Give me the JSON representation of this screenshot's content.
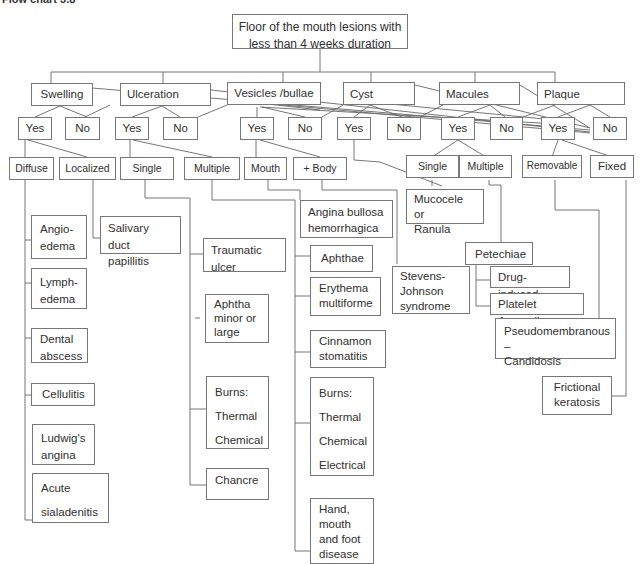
{
  "title": "Flow chart 3.8",
  "root": {
    "label": "Floor of the mouth lesions with less than 4 weeks duration"
  },
  "categories": [
    {
      "label": "Swelling"
    },
    {
      "label": "Ulceration"
    },
    {
      "label": "Vesicles /bullae"
    },
    {
      "label": "Cyst"
    },
    {
      "label": "Macules"
    },
    {
      "label": "Plaque"
    }
  ],
  "answers": {
    "yes": "Yes",
    "no": "No"
  },
  "subtypes": {
    "swelling": [
      "Diffuse",
      "Localized"
    ],
    "ulceration": [
      "Single",
      "Multiple"
    ],
    "vesicles": [
      "Mouth",
      "+ Body"
    ],
    "macules": [
      "Single",
      "Multiple"
    ],
    "plaque": [
      "Removable",
      "Fixed"
    ]
  },
  "diagnoses": {
    "diffuse": [
      "Angio-\nedema",
      "Lymph-\nedema",
      "Dental\nabscess",
      "Cellulitis",
      "Ludwig's\nangina",
      "Acute\nsialadenitis"
    ],
    "localized": [
      "Salivary duct\npapillitis"
    ],
    "ulcer_single": [
      "Traumatic ulcer",
      "Aphtha\nminor or\nlarge",
      "Burns:\nThermal\nChemical",
      "Chancre"
    ],
    "ulcer_multiple": [
      "Aphthae",
      "Erythema\nmultiforme",
      "Cinnamon\nstomatitis",
      "Burns:\nThermal\nChemical\nElectrical",
      "Hand,\nmouth\nand foot\ndisease"
    ],
    "vesicles_mouth": [
      "Angina bullosa\nhemorrhagica"
    ],
    "vesicles_body": [
      "Stevens-\nJohnson\nsyndrome"
    ],
    "cyst_yes": [
      "Mucocele  or\nRanula"
    ],
    "macules_multiple": [
      "Petechiae"
    ],
    "petechiae": [
      "Drug-induced",
      "Platelet Anomalies"
    ],
    "plaque_removable": [
      "Pseudomembranous –\nCandidosis"
    ],
    "plaque_fixed": [
      "Frictional\nkeratosis"
    ]
  },
  "colors": {
    "line": "#666666",
    "border": "#777777",
    "text": "#2f2f2f"
  }
}
